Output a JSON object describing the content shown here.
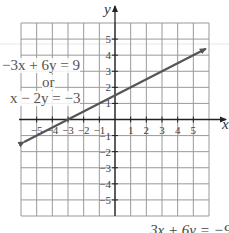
{
  "chart_data": {
    "type": "line",
    "title": "",
    "xlabel": "x",
    "ylabel": "y",
    "xlim": [
      -6,
      6
    ],
    "ylim": [
      -6,
      6
    ],
    "grid": true,
    "x_ticks": [
      "-5",
      "-4",
      "-3",
      "-2",
      "-1",
      "1",
      "2",
      "3",
      "4",
      "5"
    ],
    "y_ticks": [
      "5",
      "4",
      "3",
      "2",
      "1",
      "-1",
      "-2",
      "-3",
      "-4",
      "-5"
    ],
    "series": [
      {
        "name": "-3x + 6y = 9 or x - 2y = -3",
        "x": [
          -5.8,
          5.8
        ],
        "y": [
          -1.4,
          4.4
        ],
        "color": "#555555"
      }
    ],
    "annotations": [
      {
        "text": "−3x + 6y = 9",
        "x": -5.5,
        "y": 3.5
      },
      {
        "text": "or",
        "x": -4,
        "y": 2.5
      },
      {
        "text": "x − 2y = −3",
        "x": -5.5,
        "y": 1.5
      }
    ]
  },
  "labels": {
    "eq1": "−3x + 6y = 9",
    "or": "or",
    "eq2": "x − 2y = −3",
    "bottom_text": "3x + 6y = −9"
  }
}
